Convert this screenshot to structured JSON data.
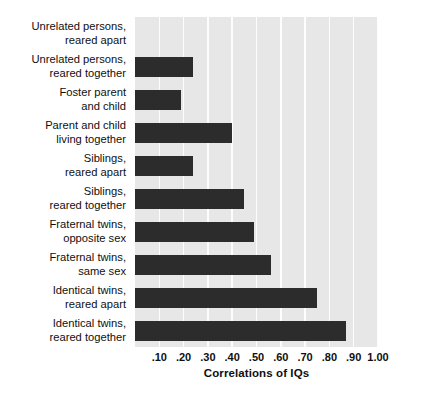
{
  "chart_data": {
    "type": "bar",
    "orientation": "horizontal",
    "title": "",
    "xlabel": "Correlations of IQs",
    "ylabel": "",
    "xlim": [
      0,
      1.0
    ],
    "xticks": [
      0.1,
      0.2,
      0.3,
      0.4,
      0.5,
      0.6,
      0.7,
      0.8,
      0.9,
      1.0
    ],
    "xtick_labels": [
      ".10",
      ".20",
      ".30",
      ".40",
      ".50",
      ".60",
      ".70",
      ".80",
      ".90",
      "1.00"
    ],
    "grid": true,
    "legend": null,
    "categories": [
      "Unrelated persons, reared apart",
      "Unrelated persons, reared together",
      "Foster parent and child",
      "Parent and child living together",
      "Siblings, reared apart",
      "Siblings, reared together",
      "Fraternal twins, opposite sex",
      "Fraternal twins, same sex",
      "Identical twins, reared apart",
      "Identical twins, reared together"
    ],
    "category_lines": [
      [
        "Unrelated persons,",
        "reared apart"
      ],
      [
        "Unrelated persons,",
        "reared together"
      ],
      [
        "Foster parent",
        "and child"
      ],
      [
        "Parent and child",
        "living together"
      ],
      [
        "Siblings,",
        "reared apart"
      ],
      [
        "Siblings,",
        "reared together"
      ],
      [
        "Fraternal twins,",
        "opposite sex"
      ],
      [
        "Fraternal twins,",
        "same sex"
      ],
      [
        "Identical twins,",
        "reared apart"
      ],
      [
        "Identical twins,",
        "reared together"
      ]
    ],
    "values": [
      0.0,
      0.24,
      0.19,
      0.4,
      0.24,
      0.45,
      0.49,
      0.56,
      0.75,
      0.87
    ],
    "bar_color": "#2c2c2c",
    "plot_background": "#e7e7e7",
    "gridline_color": "#fdfdfd",
    "page_background": "#ffffff"
  }
}
